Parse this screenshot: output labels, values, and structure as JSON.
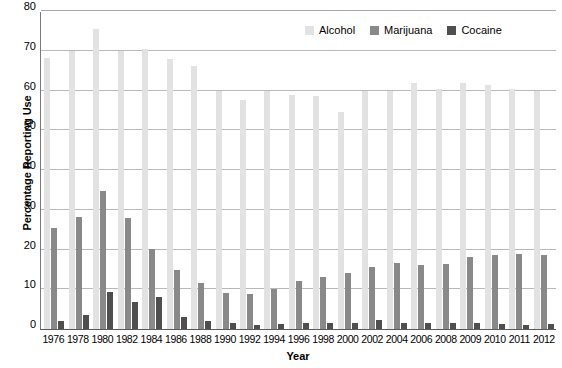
{
  "chart_data": {
    "type": "bar",
    "title": "",
    "xlabel": "Year",
    "ylabel": "Percentage Reporting Use",
    "ylim": [
      0,
      80
    ],
    "yticks": [
      0,
      10,
      20,
      30,
      40,
      50,
      60,
      70,
      80
    ],
    "grid": true,
    "legend_position": "top-right",
    "categories": [
      "1976",
      "1978",
      "1980",
      "1982",
      "1984",
      "1986",
      "1988",
      "1990",
      "1992",
      "1994",
      "1996",
      "1998",
      "2000",
      "2002",
      "2004",
      "2006",
      "2008",
      "2009",
      "2010",
      "2011",
      "2012"
    ],
    "series": [
      {
        "name": "Alcohol",
        "color": "#e2e2e2",
        "values": [
          68.3,
          69.9,
          75.4,
          69.9,
          70.5,
          67.9,
          66.1,
          60.0,
          57.7,
          60.0,
          58.8,
          58.6,
          54.6,
          60.0,
          60.0,
          61.8,
          60.5,
          61.9,
          61.4,
          60.3,
          60.0
        ]
      },
      {
        "name": "Marijuana",
        "color": "#898989",
        "values": [
          25.4,
          28.3,
          34.8,
          28.0,
          20.2,
          14.9,
          11.5,
          9.0,
          8.8,
          10.0,
          12.0,
          13.1,
          14.0,
          15.5,
          16.7,
          16.2,
          16.4,
          18.0,
          18.5,
          18.8,
          18.7
        ]
      },
      {
        "name": "Cocaine",
        "color": "#4f4f4f",
        "values": [
          1.9,
          3.5,
          9.3,
          6.7,
          8.1,
          3.0,
          2.1,
          1.4,
          1.1,
          1.3,
          1.5,
          1.6,
          1.5,
          2.2,
          1.6,
          1.6,
          1.4,
          1.4,
          1.3,
          1.1,
          1.2
        ]
      }
    ]
  },
  "legend": {
    "items": [
      {
        "label": "Alcohol",
        "key": "alcohol"
      },
      {
        "label": "Marijuana",
        "key": "marijuana"
      },
      {
        "label": "Cocaine",
        "key": "cocaine"
      }
    ]
  },
  "axes": {
    "y_title": "Percentage Reporting Use",
    "x_title": "Year"
  }
}
